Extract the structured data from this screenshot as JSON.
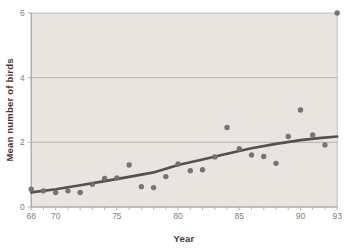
{
  "figure": {
    "kind": "static-textbook-scatterplot"
  },
  "chart_data": {
    "type": "scatter",
    "title": "",
    "xlabel": "Year",
    "ylabel": "Mean number of birds",
    "x_range": [
      68,
      93
    ],
    "y_range": [
      0,
      6
    ],
    "x_tick_years": [
      68,
      69,
      70,
      71,
      72,
      73,
      74,
      75,
      76,
      77,
      78,
      79,
      80,
      81,
      82,
      83,
      84,
      85,
      86,
      87,
      88,
      89,
      90,
      91,
      92,
      93
    ],
    "x_tick_labels": [
      {
        "year": 68,
        "label": "68"
      },
      {
        "year": 70,
        "label": "70"
      },
      {
        "year": 75,
        "label": "75"
      },
      {
        "year": 80,
        "label": "80"
      },
      {
        "year": 85,
        "label": "85"
      },
      {
        "year": 90,
        "label": "90"
      },
      {
        "year": 93,
        "label": "93"
      }
    ],
    "y_ticks": [
      {
        "value": 0,
        "label": "0"
      },
      {
        "value": 2,
        "label": "2"
      },
      {
        "value": 4,
        "label": "4"
      },
      {
        "value": 6,
        "label": "6"
      }
    ],
    "grid_y": [
      2,
      4
    ],
    "grid_on": true,
    "legend": null,
    "series": [
      {
        "name": "mean-birds-per-year",
        "x": [
          68,
          69,
          70,
          71,
          72,
          73,
          74,
          75,
          76,
          77,
          78,
          79,
          80,
          81,
          82,
          83,
          84,
          85,
          86,
          87,
          88,
          89,
          90,
          91,
          92,
          93
        ],
        "values": [
          0.55,
          0.5,
          0.45,
          0.5,
          0.45,
          0.7,
          0.88,
          0.9,
          1.3,
          0.63,
          0.6,
          0.94,
          1.33,
          1.12,
          1.15,
          1.55,
          2.46,
          1.8,
          1.61,
          1.56,
          1.35,
          2.18,
          3.0,
          2.23,
          1.92,
          6.0
        ]
      }
    ],
    "trend_line": {
      "name": "smooth-trend",
      "points": [
        [
          68,
          0.45
        ],
        [
          70,
          0.55
        ],
        [
          72,
          0.67
        ],
        [
          74,
          0.8
        ],
        [
          76,
          0.93
        ],
        [
          78,
          1.07
        ],
        [
          80,
          1.3
        ],
        [
          82,
          1.47
        ],
        [
          84,
          1.65
        ],
        [
          86,
          1.82
        ],
        [
          88,
          1.95
        ],
        [
          90,
          2.07
        ],
        [
          91.5,
          2.13
        ],
        [
          93,
          2.18
        ]
      ]
    },
    "colors": {
      "plot_bg": "#e8e5e1",
      "plot_border": "#b7b2ad",
      "grid": "#aaa49f",
      "axis": "#a8a29c",
      "tick": "#b3ada7",
      "point": "#756c6a",
      "trend": "#55504d",
      "tick_text": "#8b7d73",
      "title_text": "#473731"
    }
  }
}
